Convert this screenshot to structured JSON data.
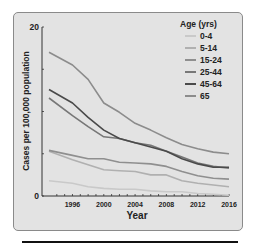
{
  "chart_data": {
    "type": "line",
    "title": "",
    "xlabel": "Year",
    "ylabel": "Cases per 100,000 population",
    "xlim": [
      1993,
      2016
    ],
    "ylim": [
      0,
      20
    ],
    "y_ticks": [
      0,
      5,
      10,
      15,
      20
    ],
    "y_tick_labels": [
      "0",
      "",
      "",
      "",
      "20"
    ],
    "x_tick_labels": [
      "1996",
      "2000",
      "2004",
      "2008",
      "2012",
      "2016"
    ],
    "grid": false,
    "legend_position": "upper right",
    "legend_title": "Age (yrs)",
    "x": [
      1993,
      1996,
      1998,
      2000,
      2002,
      2004,
      2006,
      2008,
      2010,
      2012,
      2014,
      2016
    ],
    "series": [
      {
        "name": "0-4",
        "color": "#c9c9c9",
        "values": [
          1.8,
          1.5,
          1.1,
          0.9,
          0.8,
          0.8,
          0.6,
          0.5,
          0.5,
          0.3,
          0.2,
          0.1
        ]
      },
      {
        "name": "5-14",
        "color": "#b0b0b0",
        "values": [
          5.3,
          4.3,
          3.7,
          3.1,
          3.0,
          2.9,
          2.5,
          2.5,
          1.8,
          1.5,
          1.3,
          1.1
        ]
      },
      {
        "name": "15-24",
        "color": "#8f8f8f",
        "values": [
          5.4,
          4.8,
          4.4,
          4.4,
          4.0,
          3.9,
          3.8,
          3.5,
          2.9,
          2.4,
          2.1,
          2.0
        ]
      },
      {
        "name": "25-44",
        "color": "#777777",
        "values": [
          11.6,
          9.5,
          8.2,
          7.0,
          6.8,
          6.3,
          6.0,
          5.3,
          4.6,
          3.9,
          3.5,
          3.3
        ]
      },
      {
        "name": "45-64",
        "color": "#4a4a4a",
        "values": [
          12.6,
          11.0,
          9.3,
          7.8,
          6.8,
          6.3,
          5.8,
          5.3,
          4.4,
          3.8,
          3.4,
          3.4
        ]
      },
      {
        "name": "65",
        "color": "#8c8c8c",
        "values": [
          17.0,
          15.5,
          13.8,
          11.0,
          9.9,
          8.6,
          7.8,
          6.9,
          6.1,
          5.6,
          5.2,
          5.0
        ]
      }
    ]
  }
}
